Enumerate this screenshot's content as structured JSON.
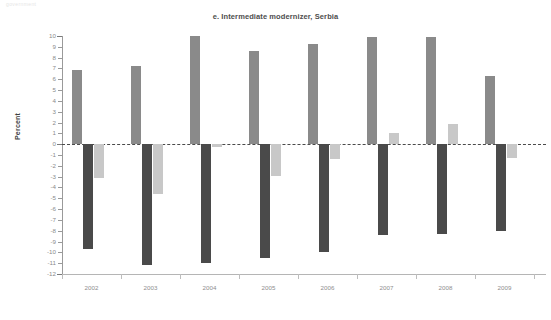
{
  "faint_header": "government",
  "chart_data": {
    "type": "bar",
    "title": "e. Intermediate modernizer, Serbia",
    "xlabel": "",
    "ylabel": "Percent",
    "categories": [
      "2002",
      "2003",
      "2004",
      "2005",
      "2006",
      "2007",
      "2008",
      "2009"
    ],
    "ylim": [
      -12,
      10
    ],
    "ytick_values": [
      10,
      9,
      8,
      7,
      6,
      5,
      4,
      3,
      2,
      1,
      0,
      -1,
      -2,
      -3,
      -4,
      -5,
      -6,
      -7,
      -8,
      -9,
      -10,
      -11,
      -12
    ],
    "ytick_labels": [
      "10",
      "9",
      "8",
      "7",
      "6",
      "5",
      "4",
      "3",
      "2",
      "1",
      "0",
      "-1",
      "-2",
      "-3",
      "-4",
      "-5",
      "-6",
      "-7",
      "-8",
      "-9",
      "-10",
      "-11",
      "-12"
    ],
    "grid": false,
    "legend": "none",
    "zero_line": 0,
    "series": [
      {
        "name": "series-1",
        "color": "#8a8a8a",
        "values": [
          6.9,
          7.2,
          10.0,
          8.6,
          9.3,
          9.9,
          9.9,
          6.3
        ]
      },
      {
        "name": "series-2",
        "color": "#4a4a4a",
        "values": [
          -9.7,
          -11.2,
          -11.0,
          -10.5,
          -10.0,
          -8.4,
          -8.3,
          -8.0
        ]
      },
      {
        "name": "series-3",
        "color": "#c8c8c8",
        "values": [
          -3.1,
          -4.6,
          -0.3,
          -2.9,
          -1.4,
          1.0,
          1.9,
          -1.3
        ]
      }
    ]
  }
}
